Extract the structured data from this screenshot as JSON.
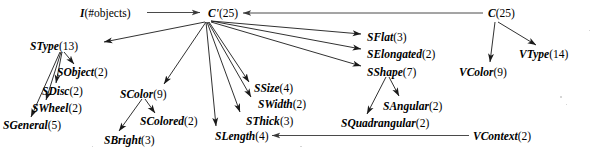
{
  "diagram": {
    "type": "directed-graph",
    "title": "",
    "background_color": "#ffffff",
    "edge_color": "#1a1a1a",
    "text_color": "#000000",
    "nodes": [
      {
        "id": "I",
        "name": "I",
        "count": "(#objects)",
        "x": 80,
        "y": 8
      },
      {
        "id": "Cprime",
        "name": "C'",
        "count": "(25)",
        "x": 208,
        "y": 8
      },
      {
        "id": "C",
        "name": "C",
        "count": "(25)",
        "x": 488,
        "y": 8
      },
      {
        "id": "SType",
        "name": "SType",
        "count": "(13)",
        "x": 30,
        "y": 41
      },
      {
        "id": "SObject",
        "name": "SObject",
        "count": "(2)",
        "x": 57,
        "y": 67
      },
      {
        "id": "SDisc",
        "name": "SDisc",
        "count": "(2)",
        "x": 42,
        "y": 86
      },
      {
        "id": "SWheel",
        "name": "SWheel",
        "count": "(2)",
        "x": 32,
        "y": 103
      },
      {
        "id": "SGeneral",
        "name": "SGeneral",
        "count": "(5)",
        "x": 3,
        "y": 120
      },
      {
        "id": "SColor",
        "name": "SColor",
        "count": "(9)",
        "x": 120,
        "y": 89
      },
      {
        "id": "SColored",
        "name": "SColored",
        "count": "(2)",
        "x": 140,
        "y": 116
      },
      {
        "id": "SBright",
        "name": "SBright",
        "count": "(3)",
        "x": 104,
        "y": 135
      },
      {
        "id": "SSize",
        "name": "SSize",
        "count": "(4)",
        "x": 254,
        "y": 83
      },
      {
        "id": "SWidth",
        "name": "SWidth",
        "count": "(2)",
        "x": 258,
        "y": 99
      },
      {
        "id": "SThick",
        "name": "SThick",
        "count": "(3)",
        "x": 246,
        "y": 116
      },
      {
        "id": "SLength",
        "name": "SLength",
        "count": "(4)",
        "x": 215,
        "y": 131
      },
      {
        "id": "SFlat",
        "name": "SFlat",
        "count": "(3)",
        "x": 367,
        "y": 32
      },
      {
        "id": "SElongated",
        "name": "SElongated",
        "count": "(2)",
        "x": 367,
        "y": 49
      },
      {
        "id": "SShape",
        "name": "SShape",
        "count": "(7)",
        "x": 367,
        "y": 67
      },
      {
        "id": "SAngular",
        "name": "SAngular",
        "count": "(2)",
        "x": 383,
        "y": 101
      },
      {
        "id": "SQuadrangular",
        "name": "SQuadrangular",
        "count": "(2)",
        "x": 341,
        "y": 118
      },
      {
        "id": "VColor",
        "name": "VColor",
        "count": "(9)",
        "x": 459,
        "y": 67
      },
      {
        "id": "VType",
        "name": "VType",
        "count": "(14)",
        "x": 519,
        "y": 49
      },
      {
        "id": "VContext",
        "name": "VContext",
        "count": "(2)",
        "x": 473,
        "y": 131
      }
    ],
    "edges": [
      {
        "from": "I",
        "to": "Cprime",
        "style": "straight"
      },
      {
        "from": "C",
        "to": "Cprime",
        "style": "straight"
      },
      {
        "from": "Cprime",
        "to": "SType",
        "style": "straight"
      },
      {
        "from": "Cprime",
        "to": "SColor",
        "style": "straight"
      },
      {
        "from": "Cprime",
        "to": "SSize",
        "style": "straight"
      },
      {
        "from": "Cprime",
        "to": "SWidth",
        "style": "straight"
      },
      {
        "from": "Cprime",
        "to": "SThick",
        "style": "straight"
      },
      {
        "from": "Cprime",
        "to": "SLength",
        "style": "straight"
      },
      {
        "from": "Cprime",
        "to": "SFlat",
        "style": "straight"
      },
      {
        "from": "Cprime",
        "to": "SElongated",
        "style": "straight"
      },
      {
        "from": "Cprime",
        "to": "SShape",
        "style": "straight"
      },
      {
        "from": "SType",
        "to": "SObject",
        "style": "straight"
      },
      {
        "from": "SType",
        "to": "SDisc",
        "style": "straight"
      },
      {
        "from": "SType",
        "to": "SWheel",
        "style": "straight"
      },
      {
        "from": "SType",
        "to": "SGeneral",
        "style": "straight"
      },
      {
        "from": "SColor",
        "to": "SColored",
        "style": "straight"
      },
      {
        "from": "SColor",
        "to": "SBright",
        "style": "straight"
      },
      {
        "from": "SShape",
        "to": "SAngular",
        "style": "straight"
      },
      {
        "from": "SShape",
        "to": "SQuadrangular",
        "style": "straight"
      },
      {
        "from": "C",
        "to": "VColor",
        "style": "straight"
      },
      {
        "from": "C",
        "to": "VType",
        "style": "straight"
      },
      {
        "from": "VContext",
        "to": "SLength",
        "style": "straight"
      }
    ]
  }
}
